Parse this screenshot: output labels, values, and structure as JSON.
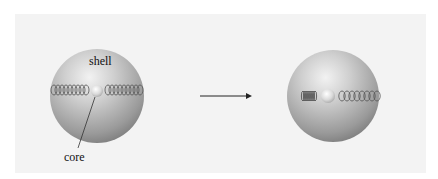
{
  "figure": {
    "type": "before-after schematic",
    "left_state": {
      "labels": {
        "shell": "shell",
        "core": "core"
      },
      "core_position": "centered",
      "left_spring": "relaxed",
      "right_spring": "relaxed"
    },
    "transition": {
      "arrow": "right-arrow"
    },
    "right_state": {
      "core_position": "displaced left",
      "left_spring": "compressed",
      "right_spring": "stretched"
    },
    "colors": {
      "background": "#ffffff",
      "panel": "#f3f3f3",
      "shell_light": "#e6e6e6",
      "shell_dark": "#7a7a7a",
      "core": "#dcdcdc",
      "spring": "#555555",
      "arrow": "#222222"
    }
  }
}
